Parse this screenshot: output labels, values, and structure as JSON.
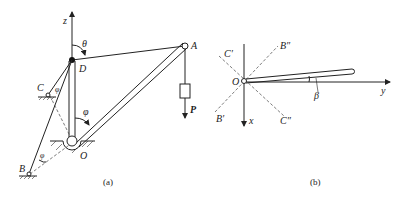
{
  "figure_a": {
    "caption": "(a)",
    "labels": {
      "z": "z",
      "theta": "θ",
      "D": "D",
      "A": "A",
      "C": "C",
      "phi_c": "φ",
      "phi_mid": "φ",
      "phi_b": "φ",
      "B": "B",
      "O": "O",
      "P": "P"
    }
  },
  "figure_b": {
    "caption": "(b)",
    "labels": {
      "C_prime": "C′",
      "B_dprime": "B″",
      "O": "O",
      "y": "y",
      "beta": "β",
      "B_prime": "B′",
      "x": "x",
      "C_dprime": "C″"
    }
  },
  "colors": {
    "line": "#222222",
    "background": "#ffffff"
  }
}
